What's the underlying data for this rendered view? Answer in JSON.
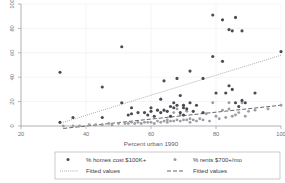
{
  "chart_data": {
    "type": "scatter",
    "title": "",
    "xlabel": "Percent urban 1990",
    "ylabel": "",
    "xlim": [
      20,
      100
    ],
    "ylim": [
      0,
      100
    ],
    "xticks": [
      20,
      40,
      60,
      80,
      100
    ],
    "yticks": [
      0,
      20,
      40,
      60,
      80,
      100
    ],
    "grid": true,
    "legend_position": "bottom",
    "legend": [
      {
        "label": "% homes cost $100K+",
        "marker": "filled-circle",
        "color": "#4a4a50"
      },
      {
        "label": "% rents $700+/mo",
        "marker": "filled-circle",
        "color": "#9d9da6"
      },
      {
        "label": "Fitted values",
        "marker": "dotted-line",
        "color": "#6b6b72"
      },
      {
        "label": "Fitted values",
        "marker": "dashed-line",
        "color": "#55555c"
      }
    ],
    "series": [
      {
        "name": "% homes cost $100K+",
        "marker": "filled-circle",
        "color": "#4a4a50",
        "points": [
          [
            32,
            44
          ],
          [
            32,
            3
          ],
          [
            36,
            7
          ],
          [
            45,
            32
          ],
          [
            45,
            7
          ],
          [
            51,
            65
          ],
          [
            51,
            19
          ],
          [
            53,
            9
          ],
          [
            54,
            10
          ],
          [
            54,
            15
          ],
          [
            56,
            11
          ],
          [
            58,
            11
          ],
          [
            59,
            9
          ],
          [
            60,
            15
          ],
          [
            60,
            12
          ],
          [
            61,
            8
          ],
          [
            62,
            13
          ],
          [
            63,
            22
          ],
          [
            63,
            11
          ],
          [
            64,
            37
          ],
          [
            64,
            13
          ],
          [
            65,
            12
          ],
          [
            66,
            8
          ],
          [
            66,
            16
          ],
          [
            67,
            15
          ],
          [
            67,
            19
          ],
          [
            68,
            39
          ],
          [
            68,
            17
          ],
          [
            69,
            11
          ],
          [
            69,
            25
          ],
          [
            70,
            15
          ],
          [
            70,
            9
          ],
          [
            70,
            17
          ],
          [
            71,
            14
          ],
          [
            72,
            19
          ],
          [
            72,
            45
          ],
          [
            73,
            12
          ],
          [
            74,
            17
          ],
          [
            76,
            39
          ],
          [
            76,
            11
          ],
          [
            79,
            91
          ],
          [
            79,
            57
          ],
          [
            80,
            27
          ],
          [
            82,
            87
          ],
          [
            82,
            53
          ],
          [
            83,
            27
          ],
          [
            84,
            79
          ],
          [
            84,
            33
          ],
          [
            85,
            78
          ],
          [
            85,
            30
          ],
          [
            86,
            19
          ],
          [
            86,
            89
          ],
          [
            87,
            16
          ],
          [
            88,
            78
          ],
          [
            88,
            21
          ],
          [
            89,
            19
          ],
          [
            92,
            27
          ],
          [
            100,
            61
          ]
        ]
      },
      {
        "name": "% rents $700+/mo",
        "marker": "filled-circle",
        "color": "#9d9da6",
        "points": [
          [
            33,
            0
          ],
          [
            36,
            0
          ],
          [
            38,
            0
          ],
          [
            41,
            1
          ],
          [
            43,
            1
          ],
          [
            45,
            1
          ],
          [
            47,
            2
          ],
          [
            48,
            1
          ],
          [
            50,
            2
          ],
          [
            52,
            2
          ],
          [
            53,
            2
          ],
          [
            54,
            3
          ],
          [
            55,
            2
          ],
          [
            56,
            3
          ],
          [
            57,
            2
          ],
          [
            58,
            3
          ],
          [
            59,
            3
          ],
          [
            60,
            3
          ],
          [
            61,
            2
          ],
          [
            62,
            4
          ],
          [
            63,
            3
          ],
          [
            64,
            4
          ],
          [
            65,
            3
          ],
          [
            65,
            5
          ],
          [
            66,
            4
          ],
          [
            66,
            8
          ],
          [
            67,
            4
          ],
          [
            67,
            11
          ],
          [
            68,
            5
          ],
          [
            68,
            14
          ],
          [
            69,
            4
          ],
          [
            69,
            9
          ],
          [
            70,
            5
          ],
          [
            70,
            17
          ],
          [
            71,
            5
          ],
          [
            71,
            12
          ],
          [
            72,
            6
          ],
          [
            72,
            3
          ],
          [
            73,
            5
          ],
          [
            74,
            4
          ],
          [
            75,
            6
          ],
          [
            76,
            5
          ],
          [
            77,
            10
          ],
          [
            78,
            4
          ],
          [
            79,
            19
          ],
          [
            80,
            8
          ],
          [
            81,
            6
          ],
          [
            82,
            13
          ],
          [
            83,
            7
          ],
          [
            84,
            19
          ],
          [
            84,
            14
          ],
          [
            85,
            8
          ],
          [
            86,
            9
          ],
          [
            87,
            11
          ],
          [
            88,
            19
          ],
          [
            89,
            8
          ],
          [
            90,
            12
          ],
          [
            92,
            13
          ],
          [
            96,
            14
          ],
          [
            100,
            17
          ]
        ]
      }
    ],
    "fitted_lines": [
      {
        "name": "Fitted values",
        "style": "dotted",
        "color": "#6b6b72",
        "x": [
          33,
          100
        ],
        "y": [
          3,
          58
        ]
      },
      {
        "name": "Fitted values",
        "style": "dashed",
        "color": "#55555c",
        "x": [
          33,
          100
        ],
        "y": [
          -2,
          17
        ]
      }
    ]
  }
}
